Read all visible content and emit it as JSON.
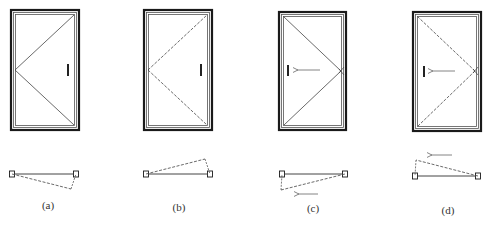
{
  "colors": {
    "frame_outer": "#1a1a1a",
    "frame_inner": "#555555",
    "line": "#444444",
    "handle": "#222222",
    "arrow": "#777777",
    "background": "#ffffff"
  },
  "figures": [
    {
      "id": "a",
      "caption": "(a)",
      "elevation": {
        "frame": {
          "x": 11,
          "y": 10,
          "w": 68,
          "h": 120
        },
        "swing_apex": {
          "x": 15,
          "y": 70
        },
        "swing_corners": [
          {
            "x": 74,
            "y": 15
          },
          {
            "x": 74,
            "y": 125
          }
        ],
        "swing_line_style": "solid",
        "handle": {
          "x": 68,
          "y1": 64,
          "y2": 76
        },
        "arrow": null
      },
      "plan": {
        "left_jamb": {
          "x": 12,
          "y": 174
        },
        "right_jamb": {
          "x": 76,
          "y": 174
        },
        "leaf_tip": {
          "x": 71,
          "y": 189
        },
        "hinge_side": "left",
        "arrow": null
      },
      "caption_pos": {
        "x": 48,
        "y": 209
      }
    },
    {
      "id": "b",
      "caption": "(b)",
      "elevation": {
        "frame": {
          "x": 144,
          "y": 10,
          "w": 68,
          "h": 120
        },
        "swing_apex": {
          "x": 148,
          "y": 70
        },
        "swing_corners": [
          {
            "x": 207,
            "y": 15
          },
          {
            "x": 207,
            "y": 125
          }
        ],
        "swing_line_style": "dashed",
        "handle": {
          "x": 201,
          "y1": 64,
          "y2": 76
        },
        "arrow": null
      },
      "plan": {
        "left_jamb": {
          "x": 146,
          "y": 174
        },
        "right_jamb": {
          "x": 210,
          "y": 174
        },
        "leaf_tip": {
          "x": 205,
          "y": 159
        },
        "hinge_side": "left",
        "arrow": null
      },
      "caption_pos": {
        "x": 179,
        "y": 211
      }
    },
    {
      "id": "c",
      "caption": "(c)",
      "elevation": {
        "frame": {
          "x": 279,
          "y": 12,
          "w": 67,
          "h": 118
        },
        "swing_apex": {
          "x": 341,
          "y": 71
        },
        "swing_corners": [
          {
            "x": 284,
            "y": 17
          },
          {
            "x": 284,
            "y": 125
          }
        ],
        "swing_line_style": "solid",
        "handle": {
          "x": 288,
          "y1": 65,
          "y2": 76
        },
        "arrow": {
          "x1": 320,
          "y1": 70,
          "x2": 297,
          "y2": 70
        }
      },
      "plan": {
        "left_jamb": {
          "x": 282,
          "y": 174
        },
        "right_jamb": {
          "x": 345,
          "y": 174
        },
        "leaf_tip": {
          "x": 281,
          "y": 190
        },
        "hinge_side": "right",
        "arrow": {
          "x1": 318,
          "y1": 194,
          "x2": 298,
          "y2": 194
        }
      },
      "caption_pos": {
        "x": 313,
        "y": 212
      }
    },
    {
      "id": "d",
      "caption": "(d)",
      "elevation": {
        "frame": {
          "x": 413,
          "y": 12,
          "w": 68,
          "h": 119
        },
        "swing_apex": {
          "x": 475,
          "y": 71
        },
        "swing_corners": [
          {
            "x": 418,
            "y": 17
          },
          {
            "x": 418,
            "y": 126
          }
        ],
        "swing_line_style": "dashed",
        "handle": {
          "x": 424,
          "y1": 66,
          "y2": 77
        },
        "arrow": {
          "x1": 455,
          "y1": 71,
          "x2": 432,
          "y2": 71
        }
      },
      "plan": {
        "left_jamb": {
          "x": 415,
          "y": 176
        },
        "right_jamb": {
          "x": 478,
          "y": 176
        },
        "leaf_tip": {
          "x": 416,
          "y": 160
        },
        "hinge_side": "right",
        "arrow": {
          "x1": 452,
          "y1": 155,
          "x2": 431,
          "y2": 155
        }
      },
      "caption_pos": {
        "x": 448,
        "y": 214
      }
    }
  ]
}
